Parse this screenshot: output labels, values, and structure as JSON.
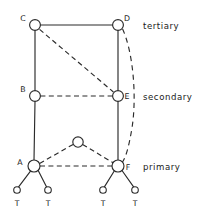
{
  "figure": {
    "background_color": "#ffffff",
    "line_color": "#2b2b2b",
    "node_fill": "#ffffff",
    "width": 221,
    "height": 216
  },
  "tier_labels": [
    {
      "id": "tertiary",
      "text": "tertiary",
      "x": 143,
      "y": 29
    },
    {
      "id": "secondary",
      "text": "secondary",
      "x": 143,
      "y": 100
    },
    {
      "id": "primary",
      "text": "primary",
      "x": 143,
      "y": 170
    }
  ],
  "nodes": [
    {
      "id": "C",
      "label": "C",
      "cx": 35,
      "cy": 25,
      "r": 5.4,
      "label_x": 23,
      "label_y": 21,
      "kind": "major"
    },
    {
      "id": "D",
      "label": "D",
      "cx": 118,
      "cy": 25,
      "r": 5.4,
      "label_x": 127,
      "label_y": 21,
      "kind": "major"
    },
    {
      "id": "B",
      "label": "B",
      "cx": 35,
      "cy": 96,
      "r": 5.4,
      "label_x": 23,
      "label_y": 92,
      "kind": "major"
    },
    {
      "id": "E",
      "label": "E",
      "cx": 118,
      "cy": 96,
      "r": 5.4,
      "label_x": 127,
      "label_y": 99,
      "kind": "major"
    },
    {
      "id": "A",
      "label": "A",
      "cx": 34,
      "cy": 166,
      "r": 6.0,
      "label_x": 20,
      "label_y": 165,
      "kind": "major"
    },
    {
      "id": "F",
      "label": "F",
      "cx": 118,
      "cy": 166,
      "r": 6.0,
      "label_x": 128,
      "label_y": 170,
      "kind": "major"
    },
    {
      "id": "M",
      "label": "",
      "cx": 78,
      "cy": 142,
      "r": 5.2,
      "label_x": 0,
      "label_y": 0,
      "kind": "bridge"
    }
  ],
  "terminal_nodes": [
    {
      "id": "T1",
      "label": "T",
      "cx": 17,
      "cy": 190,
      "r": 3.3,
      "label_x": 17,
      "label_y": 206
    },
    {
      "id": "T2",
      "label": "T",
      "cx": 48,
      "cy": 190,
      "r": 3.3,
      "label_x": 48,
      "label_y": 206
    },
    {
      "id": "T3",
      "label": "T",
      "cx": 103,
      "cy": 190,
      "r": 3.3,
      "label_x": 103,
      "label_y": 206
    },
    {
      "id": "T4",
      "label": "T",
      "cx": 135,
      "cy": 190,
      "r": 3.3,
      "label_x": 135,
      "label_y": 206
    }
  ],
  "solid_edges": [
    {
      "id": "C-D",
      "from": "C",
      "to": "D",
      "d": "M 40.4 25 L 112.6 25"
    },
    {
      "id": "C-B",
      "from": "C",
      "to": "B",
      "d": "M 35 30.4 L 35 90.6"
    },
    {
      "id": "D-E",
      "from": "D",
      "to": "E",
      "d": "M 118 30.4 L 118 90.6"
    },
    {
      "id": "B-A",
      "from": "B",
      "to": "A",
      "d": "M 35 101.4 L 34 160"
    },
    {
      "id": "E-F",
      "from": "E",
      "to": "F",
      "d": "M 118 101.4 L 118 160"
    },
    {
      "id": "A-T1",
      "from": "A",
      "to": "T1",
      "d": "M 30.5 171.1 L 18.6 186.9"
    },
    {
      "id": "A-T2",
      "from": "A",
      "to": "T2",
      "d": "M 38.2 170.5 L 46.6 186.9"
    },
    {
      "id": "F-T3",
      "from": "F",
      "to": "T3",
      "d": "M 114.4 170.8 L 104.4 186.9"
    },
    {
      "id": "F-T4",
      "from": "F",
      "to": "T4",
      "d": "M 122.0 170.5 L 133.6 186.9"
    }
  ],
  "dashed_edges": [
    {
      "id": "C-E",
      "from": "C",
      "to": "E",
      "d": "M 39.6 29.4 L 113.4 92.0"
    },
    {
      "id": "B-E",
      "from": "B",
      "to": "E",
      "d": "M 40.4 96 L 112.6 96"
    },
    {
      "id": "A-F",
      "from": "A",
      "to": "F",
      "d": "M 40.0 166 L 112.0 166"
    },
    {
      "id": "A-M",
      "from": "A",
      "to": "M",
      "d": "M 39.6 163.5 L 73.3 144.3"
    },
    {
      "id": "M-F",
      "from": "M",
      "to": "F",
      "d": "M 82.6 144.4 L 113.2 162.8"
    }
  ],
  "dashed_curves": [
    {
      "id": "D-F",
      "from": "D",
      "to": "F",
      "d": "M 122.6 29.0 C 133 52, 137 96, 132 128 C 129 146, 126 157, 122.5 162.0"
    }
  ]
}
